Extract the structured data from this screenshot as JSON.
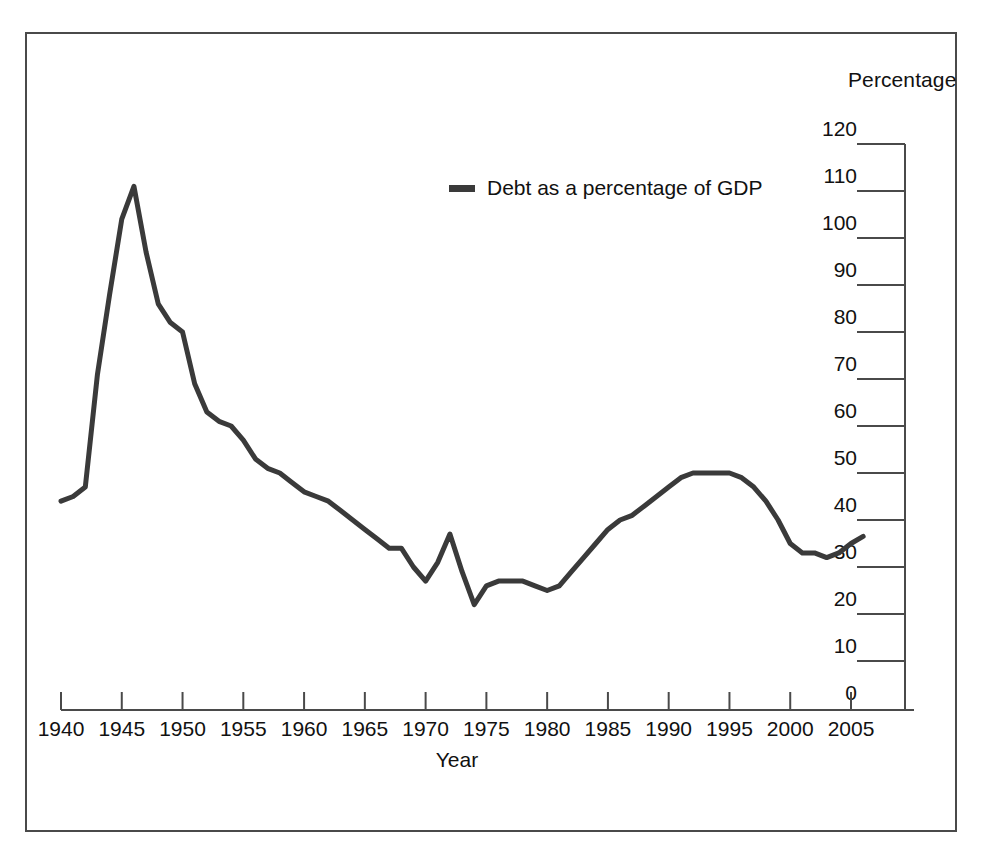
{
  "figure": {
    "unit_label": "Percentage",
    "x_axis_title": "Year"
  },
  "legend": {
    "marker_name": "line-swatch",
    "label": "Debt as a percentage of GDP",
    "color": "#3a3a3a"
  },
  "chart_data": {
    "type": "line",
    "title": "",
    "subtitle": "",
    "xlabel": "Year",
    "ylabel": "Percentage",
    "xlim": [
      1940,
      2006
    ],
    "ylim": [
      0,
      120
    ],
    "grid": false,
    "legend_position": "inside-top-center",
    "y_ticks": [
      0,
      10,
      20,
      30,
      40,
      50,
      60,
      70,
      80,
      90,
      100,
      110,
      120
    ],
    "x_ticks": [
      1940,
      1945,
      1950,
      1955,
      1960,
      1965,
      1970,
      1975,
      1980,
      1985,
      1990,
      1995,
      2000,
      2005
    ],
    "y_tick_labels": [
      "0",
      "10",
      "20",
      "30",
      "40",
      "50",
      "60",
      "70",
      "80",
      "90",
      "100",
      "110",
      "120"
    ],
    "x_tick_labels": [
      "1940",
      "1945",
      "1950",
      "1955",
      "1960",
      "1965",
      "1970",
      "1975",
      "1980",
      "1985",
      "1990",
      "1995",
      "2000",
      "2005"
    ],
    "series": [
      {
        "name": "Debt as a percentage of GDP",
        "color": "#3a3a3a",
        "line_width": 5,
        "x": [
          1940,
          1941,
          1942,
          1943,
          1944,
          1945,
          1946,
          1947,
          1948,
          1949,
          1950,
          1951,
          1952,
          1953,
          1954,
          1955,
          1956,
          1957,
          1958,
          1959,
          1960,
          1961,
          1962,
          1963,
          1964,
          1965,
          1966,
          1967,
          1968,
          1969,
          1970,
          1971,
          1972,
          1973,
          1974,
          1975,
          1976,
          1977,
          1978,
          1979,
          1980,
          1981,
          1982,
          1983,
          1984,
          1985,
          1986,
          1987,
          1988,
          1989,
          1990,
          1991,
          1992,
          1993,
          1994,
          1995,
          1996,
          1997,
          1998,
          1999,
          2000,
          2001,
          2002,
          2003,
          2004,
          2005,
          2006
        ],
        "y": [
          44,
          45,
          47,
          71,
          88,
          104,
          111,
          97,
          86,
          82,
          80,
          69,
          63,
          61,
          60,
          57,
          53,
          51,
          50,
          48,
          46,
          45,
          44,
          42,
          40,
          38,
          36,
          34,
          34,
          30,
          27,
          31,
          37,
          29,
          22,
          26,
          27,
          27,
          27,
          26,
          25,
          26,
          29,
          32,
          35,
          38,
          40,
          41,
          43,
          45,
          47,
          49,
          50,
          50,
          50,
          50,
          49,
          47,
          44,
          40,
          35,
          33,
          33,
          32,
          33,
          35,
          36.5
        ]
      }
    ]
  }
}
